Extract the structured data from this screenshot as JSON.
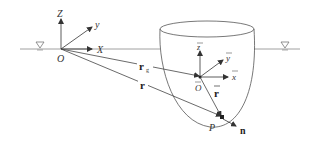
{
  "diagram": {
    "type": "coordinate-systems",
    "global_frame": {
      "origin_label": "O",
      "axes": {
        "z": "Z",
        "y": "y",
        "x": "X"
      }
    },
    "body_frame": {
      "origin_label": "O",
      "axes": {
        "z": "z",
        "y": "y",
        "x": "x"
      },
      "overbar": true
    },
    "vectors": {
      "r_g": {
        "label": "r",
        "subscript": "g"
      },
      "r": {
        "label": "r"
      },
      "r_bar": {
        "label": "r"
      },
      "normal": {
        "label": "n"
      }
    },
    "point": {
      "label": "P"
    },
    "water_surface_symbol": "▽",
    "colors": {
      "line": "#555555",
      "text": "#333333",
      "background": "#ffffff"
    }
  }
}
